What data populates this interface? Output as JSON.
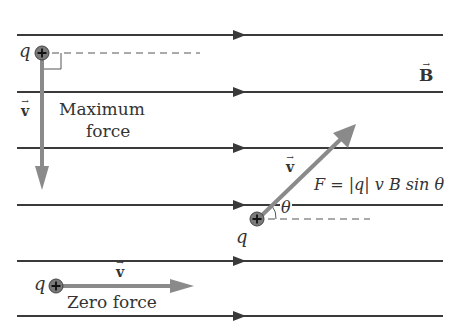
{
  "diagram": {
    "field": {
      "label": "B",
      "vector_mark": "→",
      "line_y": [
        35,
        92,
        148,
        205,
        261,
        316
      ],
      "line_x_start": 17,
      "line_x_end": 443,
      "arrow_x": 238,
      "color": "#3a3a3a"
    },
    "charges": [
      {
        "id": "max-force",
        "symbol": "+",
        "charge_label": "q",
        "velocity_label": "v",
        "caption_line1": "Maximum",
        "caption_line2": "force"
      },
      {
        "id": "angled",
        "symbol": "+",
        "charge_label": "q",
        "velocity_label": "v",
        "angle_label": "θ",
        "formula": "F = |q| v B sin θ"
      },
      {
        "id": "zero-force",
        "symbol": "+",
        "charge_label": "q",
        "velocity_label": "v",
        "caption": "Zero force"
      }
    ],
    "colors": {
      "velocity_arrow": "#8a8a8a",
      "charge_fill": "#7a7a7a",
      "text": "#333333"
    }
  }
}
